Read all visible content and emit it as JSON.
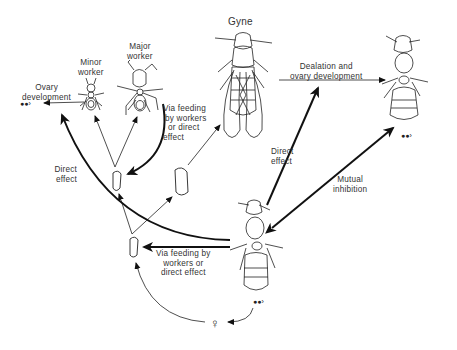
{
  "diagram": {
    "type": "caste-determination-flow",
    "nodes": {
      "gyne": {
        "label": "Gyne"
      },
      "minor_worker": {
        "label_line1": "Minor",
        "label_line2": "worker"
      },
      "major_worker": {
        "label_line1": "Major",
        "label_line2": "worker"
      },
      "dealate_queen": {
        "label": ""
      },
      "mother_queen": {
        "label": ""
      },
      "egg_symbol": "egg-cluster",
      "female_symbol": "♀",
      "larvae": [
        "larva-bottom",
        "larva-left",
        "larva-right"
      ]
    },
    "edges": [
      {
        "from": "minor_worker",
        "to": "ovary_development_eggs",
        "label_line1": "Ovary",
        "label_line2": "development"
      },
      {
        "from": "mother_queen",
        "to": "minor_worker_arrow",
        "label_line1": "Direct",
        "label_line2": "effect",
        "weight": "heavy"
      },
      {
        "from": "mother_queen",
        "to": "larva-left",
        "label_line1": "Via feeding",
        "label_line2": "by workers",
        "label_line3": "or direct",
        "label_line4": "effect",
        "weight": "heavy"
      },
      {
        "from": "gyne",
        "to": "dealate_queen",
        "label_line1": "Dealation and",
        "label_line2": "ovary development"
      },
      {
        "from": "mother_queen",
        "to": "gyne_arrow",
        "label_line1": "Direct",
        "label_line2": "effect",
        "weight": "heavy"
      },
      {
        "from": "mother_queen",
        "to": "dealate_queen",
        "label_line1": "Mutual",
        "label_line2": "inhibition",
        "weight": "heavy",
        "bidirectional": true
      },
      {
        "from": "mother_queen",
        "to": "larva-bottom",
        "label_line1": "Via feeding by",
        "label_line2": "workers or",
        "label_line3": "direct effect",
        "weight": "heavy"
      },
      {
        "from": "larva-bottom",
        "to": "larva-left"
      },
      {
        "from": "larva-bottom",
        "to": "larva-right"
      },
      {
        "from": "larva-left",
        "to": "minor_worker"
      },
      {
        "from": "larva-left",
        "to": "major_worker"
      },
      {
        "from": "larva-right",
        "to": "gyne"
      },
      {
        "from": "egg_symbol",
        "to": "female_symbol"
      },
      {
        "from": "female_symbol",
        "to": "larva-bottom"
      }
    ]
  }
}
